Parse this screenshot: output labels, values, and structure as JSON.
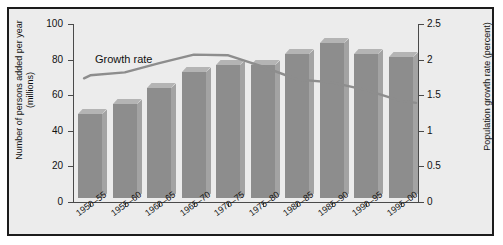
{
  "chart_data": {
    "type": "bar",
    "title": "",
    "categories": [
      "1950–55",
      "1955–60",
      "1960–65",
      "1965–70",
      "1970–75",
      "1975–80",
      "1980–85",
      "1985–90",
      "1990–95",
      "1995–00"
    ],
    "series": [
      {
        "name": "Number of persons added per year (millions)",
        "type": "bar",
        "axis": "left",
        "values": [
          47,
          53,
          62,
          71,
          75,
          75,
          81,
          87,
          81,
          79
        ]
      },
      {
        "name": "Growth rate",
        "type": "line",
        "axis": "right",
        "values": [
          1.78,
          1.82,
          1.95,
          2.07,
          2.06,
          1.9,
          1.72,
          1.68,
          1.57,
          1.42
        ]
      }
    ],
    "xlabel": "",
    "ylabel": "Number of persons added per year (millions)",
    "ylabel_right": "Population growth rate (percent)",
    "ylim": [
      0,
      100
    ],
    "ylim_right": [
      0,
      2.5
    ],
    "yticks": [
      "0",
      "20",
      "40",
      "60",
      "80",
      "100"
    ],
    "yticks_right": [
      "0",
      "0.5",
      "1",
      "1.5",
      "2",
      "2.5"
    ],
    "grid": false,
    "legend_position": "inline-annotation",
    "annotations": [
      {
        "text": "Growth rate",
        "target": "growth-rate-line"
      }
    ],
    "colors": {
      "bar": "#8d8d8d",
      "bar_top": "#b4b4b4",
      "bar_side": "#a3a3a3",
      "line": "#8d8d8d",
      "background": "#ececec",
      "border": "#1c1c1c",
      "text": "#111111",
      "axis": "#4a4a4a"
    }
  },
  "annotation": {
    "growth_rate_label": "Growth rate"
  }
}
